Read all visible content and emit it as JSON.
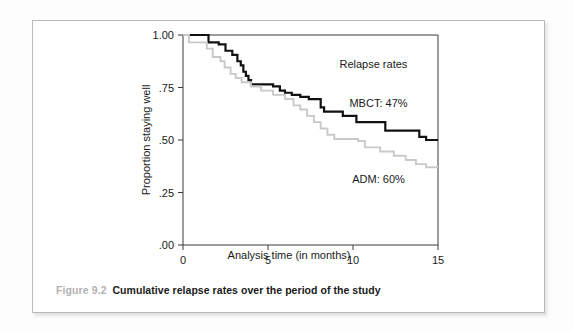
{
  "figure": {
    "number": "Figure 9.2",
    "caption": "Cumulative relapse rates over the period of the study"
  },
  "chart_data": {
    "type": "line",
    "subtype": "kaplan-meier-step",
    "title": "",
    "xlabel": "Analysis time (in months)",
    "ylabel": "Proportion staying well",
    "xlim": [
      0,
      15
    ],
    "ylim": [
      0,
      1
    ],
    "xticks": [
      0,
      5,
      10,
      15
    ],
    "xticklabels": [
      "0",
      "5",
      "10",
      "15"
    ],
    "yticks": [
      0,
      0.25,
      0.5,
      0.75,
      1.0
    ],
    "yticklabels": [
      ".00",
      ".25",
      ".50",
      ".75",
      "1.00"
    ],
    "grid": false,
    "legend_position": "inside-right",
    "annotations": [
      {
        "text": "Relapse rates",
        "x": 11.2,
        "y": 0.845
      },
      {
        "text": "MBCT: 47%",
        "x": 11.5,
        "y": 0.655
      },
      {
        "text": "ADM: 60%",
        "x": 11.5,
        "y": 0.295
      }
    ],
    "series": [
      {
        "name": "MBCT",
        "relapse_rate_percent": 47,
        "color": "#111111",
        "line_width": 2.2,
        "final_value": 0.5,
        "points": [
          [
            0.0,
            1.0
          ],
          [
            1.5,
            1.0
          ],
          [
            1.5,
            0.965
          ],
          [
            2.1,
            0.965
          ],
          [
            2.1,
            0.955
          ],
          [
            2.5,
            0.955
          ],
          [
            2.5,
            0.925
          ],
          [
            2.9,
            0.925
          ],
          [
            2.9,
            0.905
          ],
          [
            3.2,
            0.905
          ],
          [
            3.2,
            0.875
          ],
          [
            3.4,
            0.875
          ],
          [
            3.4,
            0.855
          ],
          [
            3.55,
            0.855
          ],
          [
            3.55,
            0.825
          ],
          [
            3.7,
            0.825
          ],
          [
            3.7,
            0.805
          ],
          [
            3.85,
            0.805
          ],
          [
            3.85,
            0.785
          ],
          [
            4.0,
            0.785
          ],
          [
            4.0,
            0.765
          ],
          [
            5.3,
            0.765
          ],
          [
            5.3,
            0.755
          ],
          [
            5.7,
            0.755
          ],
          [
            5.7,
            0.735
          ],
          [
            6.0,
            0.735
          ],
          [
            6.0,
            0.725
          ],
          [
            6.4,
            0.725
          ],
          [
            6.4,
            0.715
          ],
          [
            6.9,
            0.715
          ],
          [
            6.9,
            0.705
          ],
          [
            7.4,
            0.705
          ],
          [
            7.4,
            0.695
          ],
          [
            8.1,
            0.695
          ],
          [
            8.1,
            0.655
          ],
          [
            8.3,
            0.655
          ],
          [
            8.3,
            0.635
          ],
          [
            9.4,
            0.635
          ],
          [
            9.4,
            0.615
          ],
          [
            10.2,
            0.615
          ],
          [
            10.2,
            0.585
          ],
          [
            11.9,
            0.585
          ],
          [
            11.9,
            0.545
          ],
          [
            13.9,
            0.545
          ],
          [
            13.9,
            0.515
          ],
          [
            14.3,
            0.515
          ],
          [
            14.3,
            0.5
          ],
          [
            15.0,
            0.5
          ]
        ]
      },
      {
        "name": "ADM",
        "relapse_rate_percent": 60,
        "color": "#c9c9c9",
        "line_width": 1.9,
        "final_value": 0.37,
        "points": [
          [
            0.0,
            1.0
          ],
          [
            0.35,
            1.0
          ],
          [
            0.35,
            0.965
          ],
          [
            1.4,
            0.965
          ],
          [
            1.4,
            0.935
          ],
          [
            1.75,
            0.935
          ],
          [
            1.75,
            0.895
          ],
          [
            2.2,
            0.895
          ],
          [
            2.2,
            0.875
          ],
          [
            2.45,
            0.875
          ],
          [
            2.45,
            0.845
          ],
          [
            2.8,
            0.845
          ],
          [
            2.8,
            0.815
          ],
          [
            3.1,
            0.815
          ],
          [
            3.1,
            0.795
          ],
          [
            3.45,
            0.795
          ],
          [
            3.45,
            0.775
          ],
          [
            4.0,
            0.775
          ],
          [
            4.0,
            0.755
          ],
          [
            4.6,
            0.755
          ],
          [
            4.6,
            0.735
          ],
          [
            5.3,
            0.735
          ],
          [
            5.3,
            0.715
          ],
          [
            6.0,
            0.715
          ],
          [
            6.0,
            0.695
          ],
          [
            6.5,
            0.695
          ],
          [
            6.5,
            0.665
          ],
          [
            6.9,
            0.665
          ],
          [
            6.9,
            0.645
          ],
          [
            7.3,
            0.645
          ],
          [
            7.3,
            0.615
          ],
          [
            7.7,
            0.615
          ],
          [
            7.7,
            0.585
          ],
          [
            8.1,
            0.585
          ],
          [
            8.1,
            0.555
          ],
          [
            8.5,
            0.555
          ],
          [
            8.5,
            0.525
          ],
          [
            8.9,
            0.525
          ],
          [
            8.9,
            0.505
          ],
          [
            10.3,
            0.505
          ],
          [
            10.3,
            0.495
          ],
          [
            10.7,
            0.495
          ],
          [
            10.7,
            0.465
          ],
          [
            11.6,
            0.465
          ],
          [
            11.6,
            0.445
          ],
          [
            12.4,
            0.445
          ],
          [
            12.4,
            0.425
          ],
          [
            13.1,
            0.425
          ],
          [
            13.1,
            0.405
          ],
          [
            13.7,
            0.405
          ],
          [
            13.7,
            0.385
          ],
          [
            14.3,
            0.385
          ],
          [
            14.3,
            0.37
          ],
          [
            15.0,
            0.37
          ]
        ]
      }
    ]
  }
}
